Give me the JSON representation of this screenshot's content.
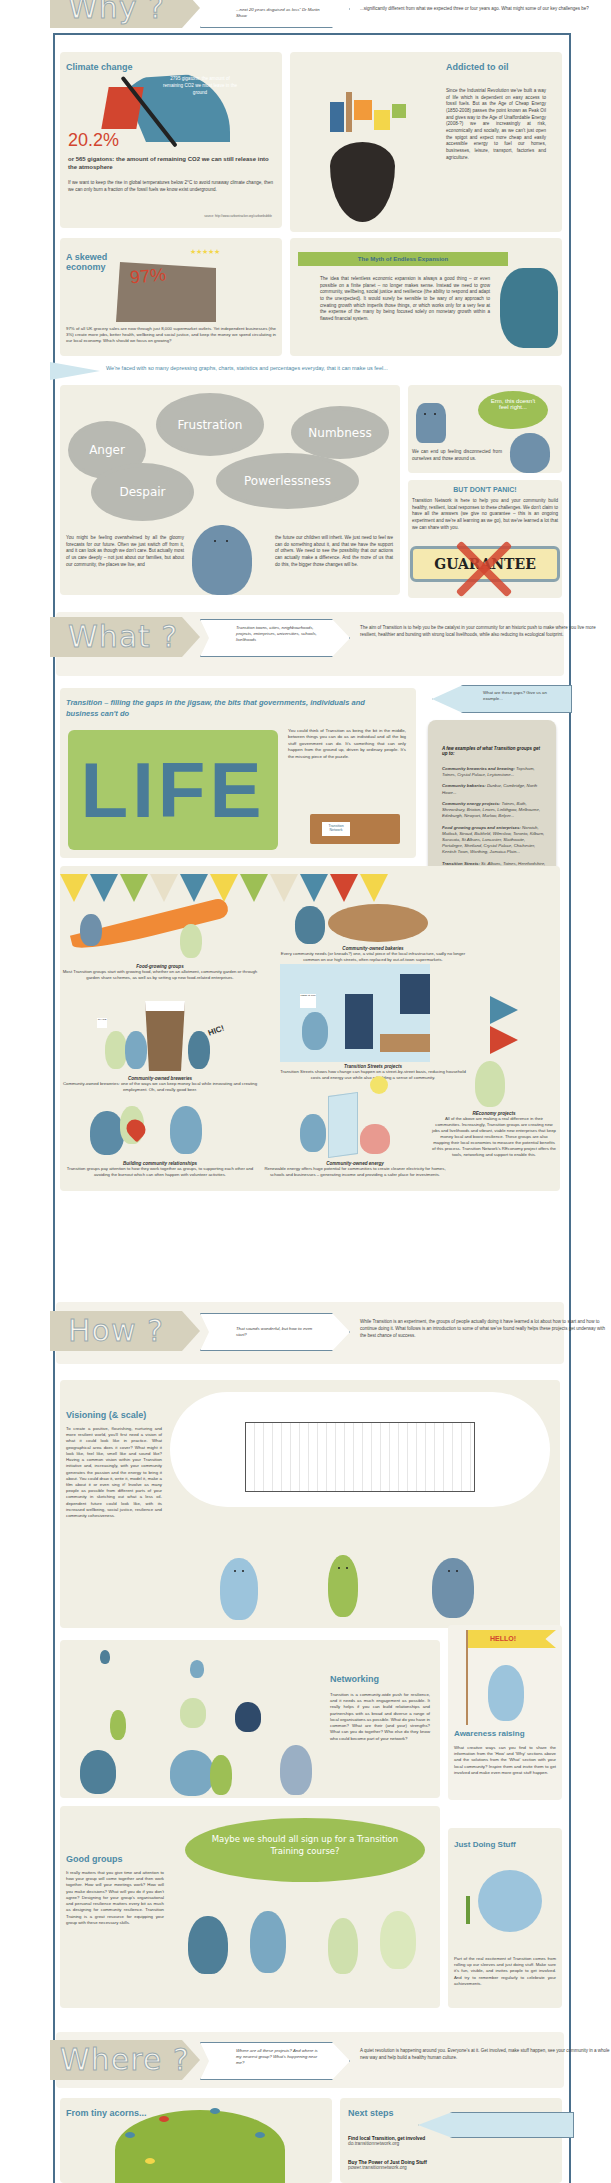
{
  "why": {
    "banner_label": "Why ?",
    "bubble_text": "...next 20 years disguised as loss\" Dr Martin Shaw",
    "lead_text": "...significantly different from what we expected three or four years ago. What might some of our key challenges be?",
    "climate": {
      "title": "Climate change",
      "gauge_text": "2795 gigatons: the amount of remaining CO2 we must leave in the ground",
      "percent": "20.2%",
      "percent_caption": "or 565 gigatons: the amount of remaining CO2 we can still release into the atmosphere",
      "body": "If we want to keep the rise in global temperatures below 2°C to avoid runaway climate change, then we can only burn a fraction of the fossil fuels we know exist underground.",
      "source": "source: http://www.carbontracker.org/carbonbubble"
    },
    "oil": {
      "title": "Addicted to oil",
      "body": "Since the Industrial Revolution we've built a way of life which is dependent on easy access to fossil fuels. But as the Age of Cheap Energy (1850-2008) passes the point known as Peak Oil and gives way to the Age of Unaffordable Energy (2008-?) we are increasingly at risk, economically and socially, as we can't just open the spigot and expect more cheap and easily accessible energy to fuel our homes, businesses, leisure, transport, factories and agriculture."
    },
    "economy": {
      "title": "A skewed economy",
      "percent": "97%",
      "body": "97% of all UK grocery sales are now through just 8,000 supermarket outlets. Yet independent businesses (the 3%) create more jobs, better health, wellbeing and social justice, and keep the money we spend circulating in our local economy. Which should we focus on growing?",
      "source": "source: Portas, M. (2011) The Portas Review: an independent review into the future of our high streets. Department for Business, Innovation and Skills"
    },
    "myth": {
      "title": "The Myth of Endless Expansion",
      "body": "The idea that relentless economic expansion is always a good thing – or even possible on a finite planet – no longer makes sense. Instead we need to grow community, wellbeing, social justice and resilience (the ability to respond and adapt to the unexpected). It would surely be sensible to be wary of any approach to creating growth which imperils those things, or which works only for a very few at the expense of the many by being focused solely on monetary growth within a flawed financial system."
    },
    "feel_pointer": "We're faced with so many depressing graphs, charts, statistics and percentages everyday, that it can make us feel...",
    "feelings": [
      "Anger",
      "Frustration",
      "Numbness",
      "Despair",
      "Powerlessness"
    ],
    "speech": "Erm, this doesn't feel right...",
    "disconnected": "We can end up feeling disconnected from ourselves and those around us.",
    "overwhelmed_left": "You might be feeling overwhelmed by all the gloomy forecasts for our future. Often we just switch off from it, and it can look as though we don't care. But actually most of us care deeply – not just about our families, but about our community, the places we live, and",
    "overwhelmed_right": "the future our children will inherit. We just need to feel we can do something about it, and that we have the support of others. We need to see the possibility that our actions can actually make a difference. And the more of us that do this, the bigger those changes will be.",
    "dont_panic": {
      "title": "BUT DON'T PANIC!",
      "body": "Transition Network is here to help you and your community build healthy, resilient, local responses to these challenges. We don't claim to have all the answers (we give no guarantee – this is an ongoing experiment and we're all learning as we go), but we've learned a lot that we can share with you.",
      "stamp": "GUARANTEE"
    }
  },
  "what": {
    "banner_label": "What ?",
    "bubble_text": "Transition towns, cities, neighbourhoods, projects, enterprises, universities, schools, livelihoods",
    "lead_text": "The aim of Transition is to help you be the catalyst in your community for an historic push to make where you live more resilient, healthier and bursting with strong local livelihoods, while also reducing its ecological footprint.",
    "gaps_pointer": "What are these gaps? Give us an example...",
    "jigsaw_title": "Transition – filling the gaps in the jigsaw, the bits that governments, individuals and business can't do",
    "life_word": "LIFE",
    "jigsaw_body": "You could think of Transition as being the bit in the middle, between things you can do as an individual and all the big stuff government can do. It's something that can only happen from the ground up, driven by ordinary people. It's the missing piece of the puzzle.",
    "box_label": "Transition Network",
    "examples": {
      "intro": "A few examples of what Transition groups get up to:",
      "items": [
        {
          "label": "Community breweries and brewing:",
          "places": "Topsham, Totnes, Crystal Palace, Leytonstone..."
        },
        {
          "label": "Community bakeries:",
          "places": "Dunbar, Cambridge, North Howe..."
        },
        {
          "label": "Community energy projects:",
          "places": "Totnes, Bath, Shrewsbury, Brixton, Lewes, Linlithgow, Melbourne, Edinburgh, Newport, Marlow, Belper..."
        },
        {
          "label": "Food growing groups and enterprises:",
          "places": "Norwich, Matlock, Stroud, Bickfield, Wilmslow, Toronto, Kilburn, Sarasota, St Albans, Lancaster, Slaithwaite, Portalegre, Shetland, Crystal Palace, Chichester, Kentish Town, Worthing, Jamaica Plain..."
        },
        {
          "label": "Transition Streets:",
          "places": "St. Albans, Totnes, Herefordshire, Blewbury, Kingsbridge, Dorchester, Suffolk coast, Reading..."
        },
        {
          "label": "Arts in Transition projects:",
          "places": "Tooting, Liverpool, Kendal, Totnes, Heathrow..."
        }
      ],
      "more": "For more projects, see http://www.transitionnetwork.org/projects"
    },
    "projects": [
      {
        "title": "Food-growing groups",
        "body": "Most Transition groups start with growing food, whether on an allotment, community garden or through garden share schemes, as well as by setting up new food-related enterprises."
      },
      {
        "title": "Community-owned bakeries",
        "body": "Every community needs (or kneads?) one, a vital piece of the local infrastructure, sadly no longer common on our high streets, often replaced by out-of-town supermarkets."
      },
      {
        "title": "Community-owned breweries",
        "body": "Community-owned breweries: one of the ways we can keep money local while innovating and creating employment. Oh, and really good beer."
      },
      {
        "title": "Transition Streets projects",
        "body": "Transition Streets shows how change can happen on a street-by-street basis, reducing household costs and energy use while also rebuilding a sense of community."
      },
      {
        "title": "Building community relationships",
        "body": "Transition groups pay attention to how they work together as groups, to supporting each other and avoiding the burnout which can often happen with volunteer activities."
      },
      {
        "title": "Community-owned energy",
        "body": "Renewable energy offers huge potential for communities to create cleaner electricity for homes, schools and businesses – generating income and providing a safer place for investments."
      },
      {
        "title": "REconomy projects",
        "body": "All of the above are making a real difference in their communities. Increasingly, Transition groups are creating new jobs and livelihoods and vibrant, viable new enterprises that keep money local and boost resilience. These groups are also mapping their local economies to measure the potential benefits of this process. Transition Network's REconomy project offers the tools, networking and support to enable this."
      }
    ],
    "sign_text": "SHARE",
    "hic": "HIC!",
    "poster": "MEET at 7pm"
  },
  "how": {
    "banner_label": "How ?",
    "bubble_text": "That sounds wonderful, but how to even start?",
    "lead_text": "While Transition is an experiment, the groups of people actually doing it have learned a lot about how to start and how to continue doing it. What follows is an introduction to some of what we've found really helps these projects get underway with the best chance of success.",
    "visioning": {
      "title": "Visioning (& scale)",
      "body": "To create a positive, flourishing, nurturing and more resilient world, you'll first need a vision of what it could look like in practice. What geographical area does it cover? What might it look like, feel like, smell like and sound like? Having a common vision within your Transition initiative and, increasingly, with your community generates the passion and the energy to bring it about. You could draw it, write it, model it, make a film about it or even sing it! Involve as many people as possible from different parts of your community in sketching out what a less oil-dependent future could look like, with its increased wellbeing, social justice, resilience and community cohesiveness."
    },
    "networking": {
      "title": "Networking",
      "body": "Transition is a community-wide push for resilience, and it needs as much engagement as possible. It really helps if you can build relationships and partnerships with as broad and diverse a range of local organisations as possible. What do you have in common? What are their (and your) strengths? What can you do together? Who else do they know who could become part of your network?"
    },
    "awareness": {
      "flag": "HELLO!",
      "title": "Awareness raising",
      "body": "What creative ways can you find to share the information from the 'How' and 'Why' sections above and the solutions from the 'What' section with your local community? Inspire them and invite them to get involved and make even more great stuff happen."
    },
    "good_groups": {
      "title": "Good groups",
      "body": "It really matters that you give time and attention to how your group will come together and then work together. How will your meetings work? How will you make decisions? What will you do if you don't agree? Designing for your group's organisational and personal resilience matters every bit as much as designing for community resilience. Transition Training is a great resource for equipping your group with these necessary skills.",
      "speech": "Maybe we should all sign up for a Transition Training course?"
    },
    "just_doing": {
      "title": "Just Doing Stuff",
      "body": "Part of the real excitement of Transition comes from rolling up our sleeves and just doing stuff. Make sure it's fun, visible, and invites people to get involved. And try to remember regularly to celebrate your achievements."
    }
  },
  "where": {
    "banner_label": "Where ?",
    "bubble_text": "Where are all these projects? And where is my nearest group? What's happening near me?",
    "lead_text": "A quiet revolution is happening around you. Everyone's at it. Get involved, make stuff happen, see your community in a whole new way and help build a healthy human culture.",
    "acorns_title": "From tiny acorns...",
    "next_steps": {
      "title": "Next steps",
      "items": [
        {
          "label": "Find local Transition, get involved",
          "url": "do.transitionnetwork.org"
        },
        {
          "label": "Buy The Power of Just Doing Stuff",
          "url": "power.transitionnetwork.org"
        }
      ]
    }
  },
  "colors": {
    "accent_blue": "#4d8aa6",
    "frame_blue": "#4a6f8c",
    "panel_bg": "#f1efe4",
    "green": "#9dbf55",
    "red": "#d2452f",
    "cloud_grey": "#b8b9b2"
  }
}
